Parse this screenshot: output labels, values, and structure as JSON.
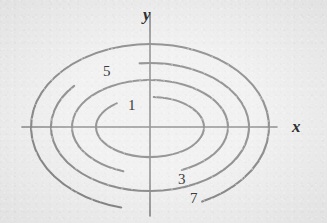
{
  "figure": {
    "kind": "contour-plot",
    "width": 327,
    "height": 223,
    "background_color": "#ececec",
    "curve_color": "#6b6b6b",
    "axis_color": "#6b6b6b",
    "label_color": "#3c3c3c",
    "axis_label_color": "#2e2e2e"
  },
  "axes": {
    "origin": {
      "x": 150,
      "y": 127
    },
    "x_axis": {
      "label": "x",
      "x_start": 22,
      "x_end": 277,
      "label_x": 292,
      "label_y": 118
    },
    "y_axis": {
      "label": "y",
      "y_start": 14,
      "y_end": 216,
      "label_x": 143,
      "label_y": 6
    }
  },
  "chart_data": {
    "type": "contour",
    "title": "",
    "xlabel": "x",
    "ylabel": "y",
    "grid": false,
    "legend": "none",
    "center": {
      "x": 0,
      "y": 0
    },
    "levels": [
      1,
      3,
      5,
      7
    ],
    "contours": [
      {
        "value": "1",
        "semi_major_px": 54,
        "semi_minor_px": 30,
        "label_px": {
          "x": 128,
          "y": 98
        },
        "label_gap_deg": {
          "start": 86,
          "end": 128
        }
      },
      {
        "value": "3",
        "semi_major_px": 78,
        "semi_minor_px": 47,
        "label_px": {
          "x": 178,
          "y": 172
        },
        "label_gap_deg": {
          "start": 250,
          "end": 294
        }
      },
      {
        "value": "5",
        "semi_major_px": 99,
        "semi_minor_px": 64,
        "label_px": {
          "x": 103,
          "y": 64
        },
        "label_gap_deg": {
          "start": 96,
          "end": 140
        }
      },
      {
        "value": "7",
        "semi_major_px": 119,
        "semi_minor_px": 83,
        "label_px": {
          "x": 190,
          "y": 191
        },
        "label_gap_deg": {
          "start": 256,
          "end": 296
        }
      }
    ]
  }
}
